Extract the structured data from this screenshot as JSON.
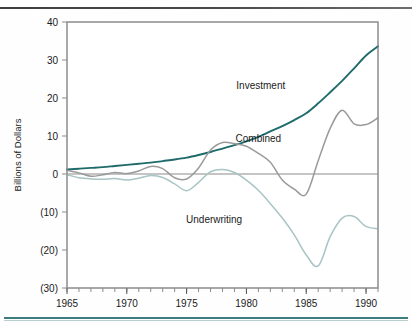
{
  "chart_data": {
    "type": "line",
    "title": "",
    "subtitle": "",
    "xlabel": "",
    "ylabel": "Billions of Dollars",
    "xlim": [
      1965,
      1991
    ],
    "ylim": [
      -30,
      40
    ],
    "grid": false,
    "legend_position": "inline-annotations",
    "yticks": [
      40,
      30,
      20,
      10,
      0,
      -10,
      -20,
      -30
    ],
    "ytick_labels": [
      "40",
      "30",
      "20",
      "10",
      "0",
      "(10)",
      "(20)",
      "(30)"
    ],
    "xticks": [
      1965,
      1970,
      1975,
      1980,
      1985,
      1990
    ],
    "xtick_labels": [
      "1965",
      "1970",
      "1975",
      "1980",
      "1985",
      "1990"
    ],
    "x_minor_tick_interval": 1,
    "zero_line": true,
    "x": [
      1965,
      1966,
      1967,
      1968,
      1969,
      1970,
      1971,
      1972,
      1973,
      1974,
      1975,
      1976,
      1977,
      1978,
      1979,
      1980,
      1981,
      1982,
      1983,
      1984,
      1985,
      1986,
      1987,
      1988,
      1989,
      1990,
      1991
    ],
    "series": [
      {
        "name": "Investment",
        "color": "#1f6b6b",
        "label_x": 1981.2,
        "label_y": 22.5,
        "values": [
          1.2,
          1.4,
          1.6,
          1.8,
          2.1,
          2.4,
          2.7,
          3.0,
          3.4,
          3.8,
          4.3,
          5.0,
          5.8,
          6.7,
          7.6,
          8.6,
          9.8,
          11.2,
          12.6,
          14.2,
          16.0,
          18.6,
          21.5,
          24.5,
          27.8,
          31.2,
          33.6
        ]
      },
      {
        "name": "Combined",
        "color": "#9a9a9a",
        "label_x": 1981.0,
        "label_y": 8.5,
        "values": [
          1.0,
          0.3,
          -0.6,
          -0.2,
          0.4,
          0.1,
          0.8,
          2.0,
          1.4,
          -1.0,
          -1.3,
          1.6,
          6.3,
          8.3,
          8.0,
          7.3,
          5.4,
          3.1,
          -1.6,
          -4.0,
          -5.3,
          3.5,
          12.0,
          16.8,
          13.2,
          13.0,
          14.8
        ]
      },
      {
        "name": "Underwriting",
        "color": "#a8c4c4",
        "label_x": 1977.3,
        "label_y": -12.8,
        "values": [
          -0.2,
          -1.0,
          -1.3,
          -1.4,
          -1.2,
          -1.6,
          -1.1,
          -0.4,
          -0.9,
          -2.6,
          -4.4,
          -2.2,
          0.6,
          1.2,
          0.4,
          -1.6,
          -4.3,
          -7.8,
          -11.6,
          -16.0,
          -21.3,
          -24.2,
          -16.5,
          -11.6,
          -11.2,
          -13.8,
          -14.4
        ]
      }
    ]
  },
  "axis": {
    "ylabel": "Billions of Dollars"
  }
}
